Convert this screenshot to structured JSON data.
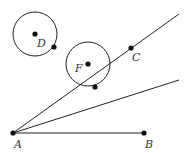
{
  "diagram": {
    "stroke_color": "#222222",
    "point_color": "#111111",
    "label_color": "#333333",
    "points": {
      "A": {
        "label": "A",
        "x": 13,
        "y": 133,
        "lx": 14,
        "ly": 148
      },
      "B": {
        "label": "B",
        "x": 144,
        "y": 133,
        "lx": 145,
        "ly": 148
      },
      "C": {
        "label": "C",
        "x": 131,
        "y": 48,
        "lx": 132,
        "ly": 61
      },
      "D": {
        "label": "D",
        "x": 35,
        "y": 34,
        "lx": 37,
        "ly": 47
      },
      "F": {
        "label": "F",
        "x": 88,
        "y": 64,
        "lx": 75,
        "ly": 72
      }
    },
    "unlabeled_points": [
      {
        "name": "point-on-circle-d",
        "x": 54,
        "y": 47
      },
      {
        "name": "point-on-circle-f",
        "x": 95,
        "y": 87
      }
    ],
    "circles": [
      {
        "name": "circle-d",
        "cx": 35,
        "cy": 34,
        "r": 22
      },
      {
        "name": "circle-f",
        "cx": 88,
        "cy": 64,
        "r": 22
      }
    ],
    "segments": [
      {
        "name": "segment-ab",
        "x1": 13,
        "y1": 133,
        "x2": 144,
        "y2": 133
      },
      {
        "name": "ray-ac",
        "x1": 13,
        "y1": 133,
        "x2": 179,
        "y2": 14
      },
      {
        "name": "ray-lower",
        "x1": 13,
        "y1": 133,
        "x2": 179,
        "y2": 80
      }
    ]
  }
}
